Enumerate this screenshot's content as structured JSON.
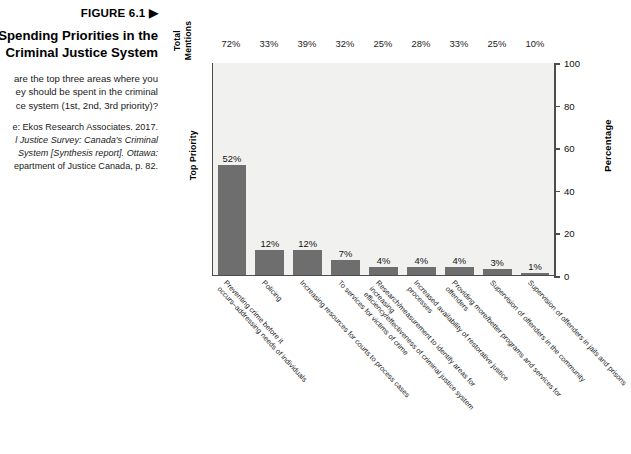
{
  "figure": {
    "number": "FIGURE 6.1 ▶",
    "title": "Spending Priorities in the\nCriminal Justice System",
    "title_line1": "Spending Priorities in the",
    "title_line2": "Criminal Justice System",
    "question": "are the top three areas where you\ney should be spent in the criminal\nce system (1st, 2nd, 3rd priority)?",
    "question_line1": "are the top three areas where you",
    "question_line2": "ey should be spent in the criminal",
    "question_line3": "ce system (1st, 2nd, 3rd priority)?",
    "source_line1": "e: Ekos Research Associates. 2017.",
    "source_line2": "l Justice Survey: Canada's Criminal",
    "source_line3": " System [Synthesis report]. Ottawa:",
    "source_line4": "epartment of Justice Canada, p. 82."
  },
  "axis": {
    "total_mentions_label": "Total\nMentions",
    "top_priority_label": "Top Priority",
    "percentage_label": "Percentage"
  },
  "chart_data": {
    "type": "bar",
    "title": "Spending Priorities in the Criminal Justice System",
    "xlabel": "",
    "ylabel": "Percentage",
    "ylim": [
      0,
      100
    ],
    "yticks": [
      0,
      20,
      40,
      60,
      80,
      100
    ],
    "grid": false,
    "legend": null,
    "bar_color": "#6e6e6e",
    "plot_background": "#f1f1ef",
    "categories": [
      "Preventing crime before it occurs–addressing needs of individuals",
      "Policing",
      "Increasing resources for courts to process cases",
      "To services for victims of crime",
      "Research/measurement to identify areas for increasing efficiency/effectiveness of criminal justice system",
      "Increased availability of restorative justice processes",
      "Providing more/better programs and services for offenders",
      "Supervision of offenders in the community",
      "Supervision of offenders in jails and prisons"
    ],
    "category_lines": [
      [
        "Preventing crime before it",
        "occurs–addressing needs of individuals"
      ],
      [
        "Policing",
        ""
      ],
      [
        "Increasing resources for courts to process cases",
        ""
      ],
      [
        "To services for victims of crime",
        ""
      ],
      [
        "Research/measurement to identify areas for increasing",
        "efficiency/effectiveness of criminal justice system"
      ],
      [
        "Increased availability of restorative justice processes",
        ""
      ],
      [
        "Providing more/better programs and services for offenders",
        ""
      ],
      [
        "Supervision of offenders in the community",
        ""
      ],
      [
        "Supervision of offenders in jails and prisons",
        ""
      ]
    ],
    "series": [
      {
        "name": "Top Priority",
        "values": [
          52,
          12,
          12,
          7,
          4,
          4,
          4,
          3,
          1
        ],
        "labels": [
          "52%",
          "12%",
          "12%",
          "7%",
          "4%",
          "4%",
          "4%",
          "3%",
          "1%"
        ]
      },
      {
        "name": "Total Mentions",
        "values": [
          72,
          33,
          39,
          32,
          25,
          28,
          33,
          25,
          10
        ],
        "labels": [
          "72%",
          "33%",
          "39%",
          "32%",
          "25%",
          "28%",
          "33%",
          "25%",
          "10%"
        ]
      }
    ]
  }
}
